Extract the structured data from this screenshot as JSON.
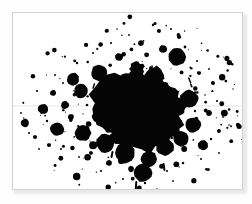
{
  "page": {
    "background_color": "#ffffff",
    "width": 252,
    "height": 204
  },
  "plate": {
    "name": "ink-splatter-plate",
    "background_color": "#ffffff",
    "border_color": "#d2d2d2",
    "shadow_color": "#e9e9e9"
  },
  "artwork": {
    "title": "",
    "kind": "ink-splatter",
    "ink_color": "#050505",
    "description": "Black ink splatter blot with dense irregular core and scattered round droplets",
    "core": {
      "cx": 128,
      "cy": 95,
      "rx": 38,
      "ry": 32
    },
    "blobs": [
      {
        "cx": 128,
        "cy": 96,
        "r": 30,
        "squish": 1.02
      },
      {
        "cx": 112,
        "cy": 88,
        "r": 22,
        "squish": 1.1
      },
      {
        "cx": 145,
        "cy": 100,
        "r": 23,
        "squish": 0.95
      },
      {
        "cx": 120,
        "cy": 110,
        "r": 21,
        "squish": 1.0
      },
      {
        "cx": 136,
        "cy": 78,
        "r": 18,
        "squish": 1.05
      },
      {
        "cx": 104,
        "cy": 104,
        "r": 16,
        "squish": 1.0
      },
      {
        "cx": 152,
        "cy": 84,
        "r": 14,
        "squish": 1.0
      },
      {
        "cx": 132,
        "cy": 118,
        "r": 16,
        "squish": 1.0
      },
      {
        "cx": 118,
        "cy": 70,
        "r": 12,
        "squish": 1.0
      },
      {
        "cx": 156,
        "cy": 112,
        "r": 13,
        "squish": 1.0
      },
      {
        "cx": 96,
        "cy": 86,
        "r": 11,
        "squish": 1.0
      },
      {
        "cx": 142,
        "cy": 62,
        "r": 9,
        "squish": 1.0
      },
      {
        "cx": 108,
        "cy": 122,
        "r": 10,
        "squish": 1.0
      },
      {
        "cx": 164,
        "cy": 94,
        "r": 9,
        "squish": 1.0
      },
      {
        "cx": 124,
        "cy": 56,
        "r": 7,
        "squish": 1.0
      }
    ],
    "droplets": [
      {
        "cx": 68,
        "cy": 78,
        "r": 7
      },
      {
        "cx": 52,
        "cy": 92,
        "r": 4
      },
      {
        "cx": 30,
        "cy": 96,
        "r": 5
      },
      {
        "cx": 12,
        "cy": 110,
        "r": 4
      },
      {
        "cx": 44,
        "cy": 116,
        "r": 7
      },
      {
        "cx": 70,
        "cy": 120,
        "r": 8
      },
      {
        "cx": 60,
        "cy": 66,
        "r": 6
      },
      {
        "cx": 86,
        "cy": 60,
        "r": 8
      },
      {
        "cx": 92,
        "cy": 130,
        "r": 9
      },
      {
        "cx": 112,
        "cy": 140,
        "r": 10
      },
      {
        "cx": 136,
        "cy": 146,
        "r": 8
      },
      {
        "cx": 152,
        "cy": 134,
        "r": 9
      },
      {
        "cx": 130,
        "cy": 160,
        "r": 9
      },
      {
        "cx": 168,
        "cy": 126,
        "r": 8
      },
      {
        "cx": 180,
        "cy": 112,
        "r": 8
      },
      {
        "cx": 176,
        "cy": 86,
        "r": 9
      },
      {
        "cx": 164,
        "cy": 44,
        "r": 9
      },
      {
        "cx": 150,
        "cy": 36,
        "r": 4
      },
      {
        "cx": 128,
        "cy": 30,
        "r": 3
      },
      {
        "cx": 106,
        "cy": 44,
        "r": 4
      },
      {
        "cx": 190,
        "cy": 132,
        "r": 5
      },
      {
        "cx": 196,
        "cy": 100,
        "r": 3
      },
      {
        "cx": 84,
        "cy": 104,
        "r": 5
      },
      {
        "cx": 58,
        "cy": 104,
        "r": 3
      },
      {
        "cx": 40,
        "cy": 80,
        "r": 3
      },
      {
        "cx": 22,
        "cy": 124,
        "r": 2
      },
      {
        "cx": 200,
        "cy": 70,
        "r": 2
      },
      {
        "cx": 186,
        "cy": 60,
        "r": 2
      },
      {
        "cx": 118,
        "cy": 156,
        "r": 3
      },
      {
        "cx": 96,
        "cy": 150,
        "r": 3
      },
      {
        "cx": 146,
        "cy": 18,
        "r": 2
      },
      {
        "cx": 166,
        "cy": 24,
        "r": 2
      },
      {
        "cx": 206,
        "cy": 118,
        "r": 2
      },
      {
        "cx": 36,
        "cy": 132,
        "r": 2
      },
      {
        "cx": 78,
        "cy": 140,
        "r": 2
      }
    ],
    "specks": [
      {
        "cx": 140,
        "cy": 12,
        "r": 1.2
      },
      {
        "cx": 158,
        "cy": 16,
        "r": 1.0
      },
      {
        "cx": 172,
        "cy": 34,
        "r": 1.4
      },
      {
        "cx": 184,
        "cy": 48,
        "r": 1.0
      },
      {
        "cx": 196,
        "cy": 56,
        "r": 0.9
      },
      {
        "cx": 204,
        "cy": 88,
        "r": 1.1
      },
      {
        "cx": 210,
        "cy": 104,
        "r": 0.9
      },
      {
        "cx": 198,
        "cy": 126,
        "r": 1.2
      },
      {
        "cx": 188,
        "cy": 146,
        "r": 1.0
      },
      {
        "cx": 170,
        "cy": 150,
        "r": 1.3
      },
      {
        "cx": 154,
        "cy": 158,
        "r": 1.0
      },
      {
        "cx": 132,
        "cy": 170,
        "r": 1.2
      },
      {
        "cx": 110,
        "cy": 166,
        "r": 1.0
      },
      {
        "cx": 88,
        "cy": 158,
        "r": 1.1
      },
      {
        "cx": 66,
        "cy": 144,
        "r": 0.9
      },
      {
        "cx": 48,
        "cy": 136,
        "r": 1.0
      },
      {
        "cx": 26,
        "cy": 136,
        "r": 0.9
      },
      {
        "cx": 16,
        "cy": 120,
        "r": 1.0
      },
      {
        "cx": 8,
        "cy": 100,
        "r": 0.9
      },
      {
        "cx": 24,
        "cy": 78,
        "r": 1.1
      },
      {
        "cx": 42,
        "cy": 62,
        "r": 1.0
      },
      {
        "cx": 64,
        "cy": 50,
        "r": 1.2
      },
      {
        "cx": 80,
        "cy": 40,
        "r": 1.0
      },
      {
        "cx": 98,
        "cy": 30,
        "r": 1.1
      },
      {
        "cx": 116,
        "cy": 22,
        "r": 0.9
      },
      {
        "cx": 104,
        "cy": 16,
        "r": 0.8
      },
      {
        "cx": 178,
        "cy": 72,
        "r": 1.0
      },
      {
        "cx": 192,
        "cy": 82,
        "r": 0.8
      },
      {
        "cx": 206,
        "cy": 140,
        "r": 0.9
      },
      {
        "cx": 160,
        "cy": 168,
        "r": 0.9
      },
      {
        "cx": 144,
        "cy": 176,
        "r": 0.8
      },
      {
        "cx": 74,
        "cy": 92,
        "r": 1.3
      },
      {
        "cx": 50,
        "cy": 70,
        "r": 1.0
      },
      {
        "cx": 34,
        "cy": 108,
        "r": 1.2
      },
      {
        "cx": 94,
        "cy": 118,
        "r": 1.4
      },
      {
        "cx": 182,
        "cy": 98,
        "r": 1.2
      },
      {
        "cx": 216,
        "cy": 112,
        "r": 0.8
      },
      {
        "cx": 220,
        "cy": 76,
        "r": 0.7
      }
    ],
    "streaks": [
      {
        "x": 122,
        "y": 168,
        "w": 2,
        "h": 10,
        "rot": 4
      },
      {
        "x": 150,
        "y": 150,
        "w": 2,
        "h": 8,
        "rot": -8
      },
      {
        "x": 98,
        "y": 138,
        "w": 2,
        "h": 7,
        "rot": 12
      },
      {
        "x": 176,
        "y": 64,
        "w": 1.5,
        "h": 7,
        "rot": -20
      },
      {
        "x": 80,
        "y": 70,
        "w": 1.5,
        "h": 6,
        "rot": 18
      }
    ]
  }
}
